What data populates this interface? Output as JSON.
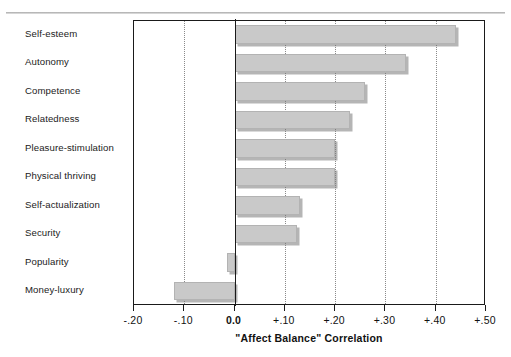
{
  "figure": {
    "top_rule_visible": true,
    "plot_background": "#ffffff",
    "bar_fill": "#c9c9c9",
    "bar_shadow": "#787878",
    "axis_color": "#1a1a1a",
    "gridline_color": "#8a8a8a"
  },
  "chart_data": {
    "type": "bar",
    "orientation": "horizontal",
    "title": "",
    "xlabel": "\"Affect Balance\" Correlation",
    "ylabel": "",
    "categories": [
      "Self-esteem",
      "Autonomy",
      "Competence",
      "Relatedness",
      "Pleasure-stimulation",
      "Physical thriving",
      "Self-actualization",
      "Security",
      "Popularity",
      "Money-luxury"
    ],
    "values": [
      0.44,
      0.34,
      0.26,
      0.23,
      0.2,
      0.2,
      0.13,
      0.125,
      -0.015,
      -0.12
    ],
    "xlim": [
      -0.2,
      0.5
    ],
    "xticks": [
      -0.2,
      -0.1,
      0.0,
      0.1,
      0.2,
      0.3,
      0.4,
      0.5
    ],
    "xtick_labels": [
      "-.20",
      "-.10",
      "0.0",
      "+.10",
      "+.20",
      "+.30",
      "+.40",
      "+.50"
    ],
    "xtick_bold": [
      false,
      false,
      true,
      false,
      false,
      false,
      false,
      false
    ],
    "gridlines_at": [
      -0.1,
      0.1,
      0.2,
      0.3,
      0.4
    ],
    "grid": true,
    "zero_line": 0.0,
    "legend": null,
    "legend_position": "none"
  }
}
